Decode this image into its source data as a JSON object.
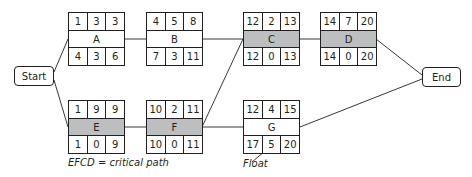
{
  "diagram": {
    "type": "activity-on-node network (critical path method)",
    "start_label": "Start",
    "end_label": "End",
    "nodes": {
      "A": {
        "label": "A",
        "critical": false,
        "top": [
          "1",
          "3",
          "3"
        ],
        "bottom": [
          "4",
          "3",
          "6"
        ]
      },
      "B": {
        "label": "B",
        "critical": false,
        "top": [
          "4",
          "5",
          "8"
        ],
        "bottom": [
          "7",
          "3",
          "11"
        ]
      },
      "C": {
        "label": "C",
        "critical": true,
        "top": [
          "12",
          "2",
          "13"
        ],
        "bottom": [
          "12",
          "0",
          "13"
        ]
      },
      "D": {
        "label": "D",
        "critical": true,
        "top": [
          "14",
          "7",
          "20"
        ],
        "bottom": [
          "14",
          "0",
          "20"
        ]
      },
      "E": {
        "label": "E",
        "critical": true,
        "top": [
          "1",
          "9",
          "9"
        ],
        "bottom": [
          "1",
          "0",
          "9"
        ]
      },
      "F": {
        "label": "F",
        "critical": true,
        "top": [
          "10",
          "2",
          "11"
        ],
        "bottom": [
          "10",
          "0",
          "11"
        ]
      },
      "G": {
        "label": "G",
        "critical": false,
        "top": [
          "12",
          "4",
          "15"
        ],
        "bottom": [
          "17",
          "5",
          "20"
        ]
      }
    },
    "edges": [
      [
        "Start",
        "A"
      ],
      [
        "Start",
        "E"
      ],
      [
        "A",
        "B"
      ],
      [
        "B",
        "C"
      ],
      [
        "C",
        "D"
      ],
      [
        "D",
        "End"
      ],
      [
        "E",
        "F"
      ],
      [
        "F",
        "C"
      ],
      [
        "F",
        "G"
      ],
      [
        "G",
        "End"
      ]
    ],
    "annotations": {
      "critical_path_caption": "EFCD = critical path",
      "float_label": "Float"
    },
    "colors": {
      "critical_fill": "#bcbec0",
      "line": "#231f20"
    }
  }
}
